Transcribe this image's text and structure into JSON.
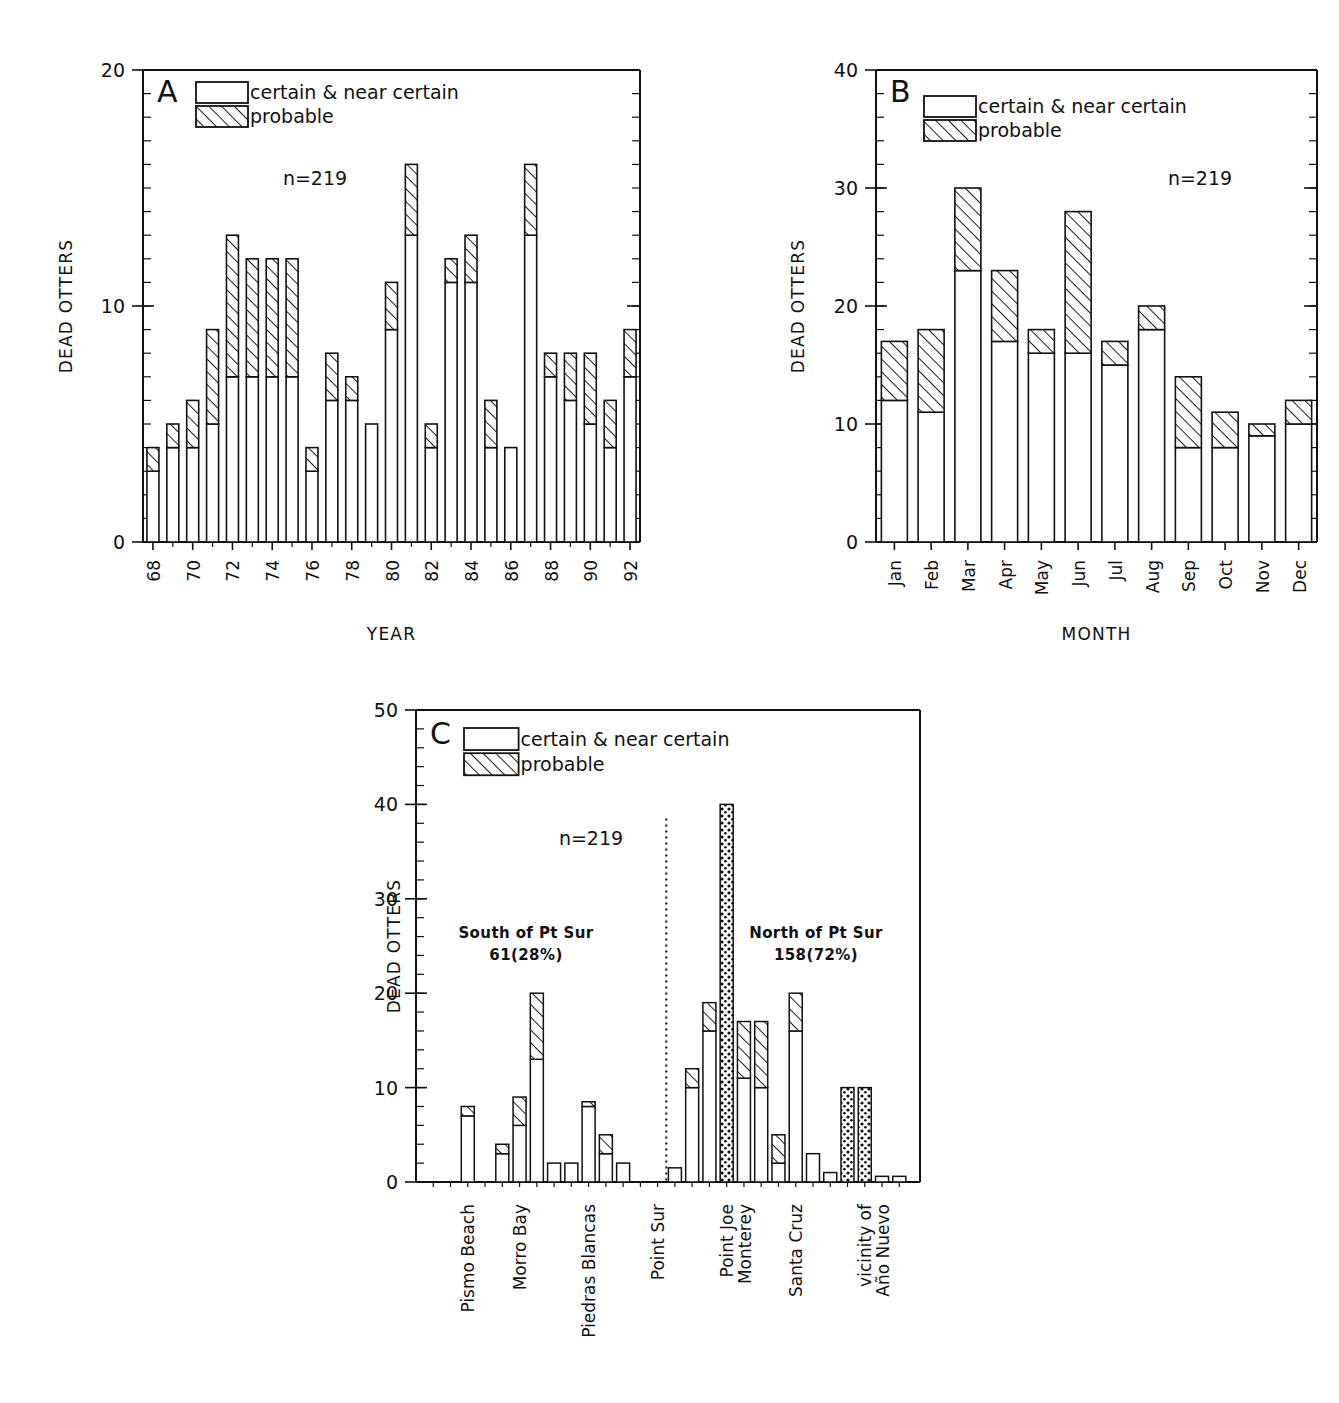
{
  "figure": {
    "ylabel": "DEAD OTTERS",
    "legend": {
      "certain_label": "certain & near certain",
      "probable_label": "probable"
    },
    "n_label": "n=219"
  },
  "chart_data": [
    {
      "type": "bar",
      "panel": "A",
      "title": "",
      "xlabel": "YEAR",
      "ylabel": "DEAD OTTERS",
      "ylim": [
        0,
        20
      ],
      "yticks": [
        0,
        10,
        20
      ],
      "ytick_labels": [
        "0",
        "10",
        "20"
      ],
      "minor_tick_step": 1,
      "grid": false,
      "legend_position": "top-left",
      "annotation": "n=219",
      "stacked": true,
      "categories": [
        "68",
        "69",
        "70",
        "71",
        "72",
        "73",
        "74",
        "75",
        "76",
        "77",
        "78",
        "79",
        "80",
        "81",
        "82",
        "83",
        "84",
        "85",
        "86",
        "87",
        "88",
        "89",
        "90",
        "91",
        "92"
      ],
      "tick_label_every": 2,
      "series": [
        {
          "name": "certain & near certain",
          "fill": "open",
          "values": [
            3,
            4,
            4,
            5,
            7,
            7,
            7,
            7,
            3,
            6,
            6,
            5,
            9,
            13,
            4,
            11,
            11,
            4,
            4,
            13,
            7,
            6,
            5,
            4,
            7
          ]
        },
        {
          "name": "probable",
          "fill": "hatch",
          "values": [
            1,
            1,
            2,
            4,
            6,
            5,
            5,
            5,
            1,
            2,
            1,
            0,
            2,
            3,
            1,
            1,
            2,
            2,
            0,
            3,
            1,
            2,
            3,
            2,
            2
          ]
        }
      ],
      "totals": [
        4,
        5,
        6,
        9,
        13,
        12,
        12,
        12,
        4,
        8,
        7,
        5,
        11,
        16,
        5,
        12,
        13,
        6,
        4,
        16,
        8,
        8,
        8,
        6,
        9
      ]
    },
    {
      "type": "bar",
      "panel": "B",
      "title": "",
      "xlabel": "MONTH",
      "ylabel": "DEAD OTTERS",
      "ylim": [
        0,
        40
      ],
      "yticks": [
        0,
        10,
        20,
        30,
        40
      ],
      "ytick_labels": [
        "0",
        "10",
        "20",
        "30",
        "40"
      ],
      "minor_tick_step": 2,
      "grid": false,
      "legend_position": "top-left",
      "annotation": "n=219",
      "stacked": true,
      "categories": [
        "Jan",
        "Feb",
        "Mar",
        "Apr",
        "May",
        "Jun",
        "Jul",
        "Aug",
        "Sep",
        "Oct",
        "Nov",
        "Dec"
      ],
      "tick_label_every": 1,
      "series": [
        {
          "name": "certain & near certain",
          "fill": "open",
          "values": [
            12,
            11,
            23,
            17,
            16,
            16,
            15,
            18,
            8,
            8,
            9,
            10
          ]
        },
        {
          "name": "probable",
          "fill": "hatch",
          "values": [
            5,
            7,
            7,
            6,
            2,
            12,
            2,
            2,
            6,
            3,
            1,
            2
          ]
        }
      ],
      "totals": [
        17,
        18,
        30,
        23,
        18,
        28,
        17,
        20,
        14,
        11,
        10,
        12
      ]
    },
    {
      "type": "bar",
      "panel": "C",
      "title": "",
      "xlabel": "",
      "ylabel": "DEAD OTTERS",
      "ylim": [
        0,
        50
      ],
      "yticks": [
        0,
        10,
        20,
        30,
        40,
        50
      ],
      "ytick_labels": [
        "0",
        "10",
        "20",
        "30",
        "40",
        "50"
      ],
      "minor_tick_step": 2,
      "grid": false,
      "legend_position": "top-left",
      "annotation": "n=219",
      "stacked": true,
      "region_labels": [
        {
          "text_line1": "South of Pt Sur",
          "text_line2": "61(28%)"
        },
        {
          "text_line1": "North of Pt Sur",
          "text_line2": "158(72%)"
        }
      ],
      "divider_label": "Point Sur",
      "x_category_labels": [
        "Pismo Beach",
        "Morro Bay",
        "Piedras Blancas",
        "Point Sur",
        "Point Joe\nMonterey",
        "Santa Cruz",
        "vicinity of\nAño Nuevo"
      ],
      "bars": [
        {
          "certain": 0,
          "probable": 0,
          "style": "open"
        },
        {
          "certain": 0,
          "probable": 0,
          "style": "open"
        },
        {
          "certain": 7,
          "probable": 1,
          "style": "open"
        },
        {
          "certain": 0,
          "probable": 0,
          "style": "open"
        },
        {
          "certain": 3,
          "probable": 1,
          "style": "open"
        },
        {
          "certain": 6,
          "probable": 3,
          "style": "open"
        },
        {
          "certain": 13,
          "probable": 7,
          "style": "open"
        },
        {
          "certain": 2,
          "probable": 0,
          "style": "open"
        },
        {
          "certain": 2,
          "probable": 0,
          "style": "open"
        },
        {
          "certain": 8,
          "probable": 0.5,
          "style": "open"
        },
        {
          "certain": 3,
          "probable": 2,
          "style": "open"
        },
        {
          "certain": 2,
          "probable": 0,
          "style": "open"
        },
        {
          "certain": 0,
          "probable": 0,
          "style": "open"
        },
        {
          "certain": 0,
          "probable": 0,
          "style": "open"
        },
        {
          "certain": 1.5,
          "probable": 0,
          "style": "open"
        },
        {
          "certain": 10,
          "probable": 2,
          "style": "open"
        },
        {
          "certain": 16,
          "probable": 3,
          "style": "open"
        },
        {
          "certain": 40,
          "probable": 0,
          "style": "dotted"
        },
        {
          "certain": 11,
          "probable": 6,
          "style": "open"
        },
        {
          "certain": 10,
          "probable": 7,
          "style": "open"
        },
        {
          "certain": 2,
          "probable": 3,
          "style": "open"
        },
        {
          "certain": 16,
          "probable": 4,
          "style": "open"
        },
        {
          "certain": 3,
          "probable": 0,
          "style": "open"
        },
        {
          "certain": 1,
          "probable": 0,
          "style": "open"
        },
        {
          "certain": 10,
          "probable": 0,
          "style": "dotted"
        },
        {
          "certain": 10,
          "probable": 0,
          "style": "dotted"
        },
        {
          "certain": 0.6,
          "probable": 0,
          "style": "open"
        },
        {
          "certain": 0.6,
          "probable": 0,
          "style": "open"
        }
      ],
      "category_tick_indices": [
        2,
        5,
        9,
        13,
        17,
        21,
        25
      ]
    }
  ]
}
